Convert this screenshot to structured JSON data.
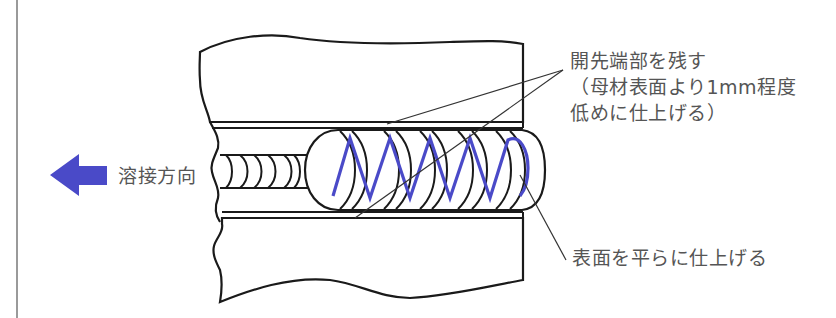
{
  "diagram": {
    "colors": {
      "outline": "#1a1a1a",
      "weave": "#4a4ac8",
      "arrow": "#4a4ac8",
      "leader": "#333333",
      "text": "#555555",
      "divider": "#9a9a9a"
    },
    "arrow": {
      "icon": "left-arrow-icon",
      "label": "溶接方向"
    },
    "callouts": {
      "groove_edge": {
        "line1": "開先端部を残す",
        "line2": "（母材表面より1mm程度",
        "line3": "低めに仕上げる）"
      },
      "surface": {
        "text": "表面を平らに仕上げる"
      }
    }
  }
}
